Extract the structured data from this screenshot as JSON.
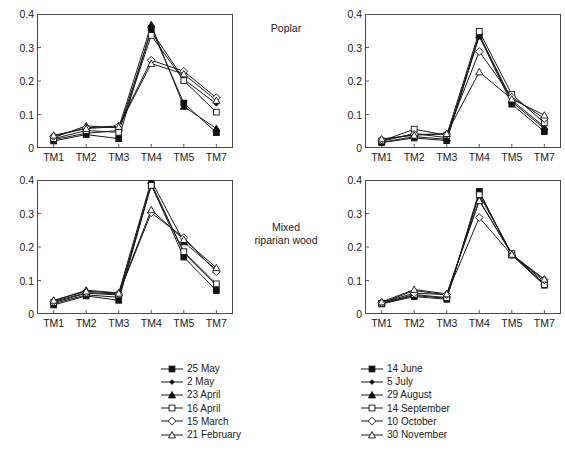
{
  "figure": {
    "row_labels": {
      "top": "Poplar",
      "bottom_line1": "Mixed",
      "bottom_line2": "riparian wood"
    },
    "caption_partial": ""
  },
  "axis": {
    "y_ticks": [
      "0",
      "0.1",
      "0.2",
      "0.3",
      "0.4"
    ],
    "x_ticks": [
      "TM1",
      "TM2",
      "TM3",
      "TM4",
      "TM5",
      "TM7"
    ]
  },
  "legends": {
    "left": {
      "name": "spring-dates-legend",
      "items": [
        {
          "label": "25 May",
          "marker": "filled-square"
        },
        {
          "label": "2 May",
          "marker": "filled-diamond"
        },
        {
          "label": "23 April",
          "marker": "filled-triangle"
        },
        {
          "label": "16 April",
          "marker": "open-square"
        },
        {
          "label": "15 March",
          "marker": "open-diamond"
        },
        {
          "label": "21 February",
          "marker": "open-triangle"
        }
      ]
    },
    "right": {
      "name": "autumn-dates-legend",
      "items": [
        {
          "label": "14 June",
          "marker": "filled-square"
        },
        {
          "label": "5 July",
          "marker": "filled-diamond"
        },
        {
          "label": "29 August",
          "marker": "filled-triangle"
        },
        {
          "label": "14 September",
          "marker": "open-square"
        },
        {
          "label": "10 October",
          "marker": "open-diamond"
        },
        {
          "label": "30 November",
          "marker": "open-triangle"
        }
      ]
    }
  },
  "chart_data": [
    {
      "id": "poplar-spring",
      "type": "line",
      "title": "Poplar",
      "panel": "top-left",
      "legend_ref": "left",
      "categories": [
        "TM1",
        "TM2",
        "TM3",
        "TM4",
        "TM5",
        "TM7"
      ],
      "xlabel": "",
      "ylabel": "",
      "ylim": [
        0,
        0.4
      ],
      "yticks": [
        0,
        0.1,
        0.2,
        0.3,
        0.4
      ],
      "grid": false,
      "legend_position": "below",
      "series": [
        {
          "name": "25 May",
          "marker": "filled-square",
          "values": [
            0.021,
            0.04,
            0.028,
            0.357,
            0.134,
            0.046
          ]
        },
        {
          "name": "2 May",
          "marker": "filled-diamond",
          "values": [
            0.025,
            0.044,
            0.052,
            0.35,
            0.205,
            0.132
          ]
        },
        {
          "name": "23 April",
          "marker": "filled-triangle",
          "values": [
            0.031,
            0.066,
            0.06,
            0.368,
            0.124,
            0.058
          ]
        },
        {
          "name": "16 April",
          "marker": "open-square",
          "values": [
            0.028,
            0.052,
            0.047,
            0.336,
            0.201,
            0.107
          ]
        },
        {
          "name": "15 March",
          "marker": "open-diamond",
          "values": [
            0.035,
            0.06,
            0.066,
            0.262,
            0.229,
            0.15
          ]
        },
        {
          "name": "21 February",
          "marker": "open-triangle",
          "values": [
            0.038,
            0.058,
            0.064,
            0.252,
            0.221,
            0.142
          ]
        }
      ]
    },
    {
      "id": "poplar-autumn",
      "type": "line",
      "title": "Poplar",
      "panel": "top-right",
      "legend_ref": "right",
      "categories": [
        "TM1",
        "TM2",
        "TM3",
        "TM4",
        "TM5",
        "TM7"
      ],
      "xlabel": "",
      "ylabel": "",
      "ylim": [
        0,
        0.4
      ],
      "yticks": [
        0,
        0.1,
        0.2,
        0.3,
        0.4
      ],
      "grid": false,
      "legend_position": "below",
      "series": [
        {
          "name": "14 June",
          "marker": "filled-square",
          "values": [
            0.016,
            0.03,
            0.022,
            0.334,
            0.131,
            0.049
          ]
        },
        {
          "name": "5 July",
          "marker": "filled-diamond",
          "values": [
            0.017,
            0.034,
            0.026,
            0.336,
            0.138,
            0.058
          ]
        },
        {
          "name": "29 August",
          "marker": "filled-triangle",
          "values": [
            0.02,
            0.043,
            0.031,
            0.338,
            0.143,
            0.063
          ]
        },
        {
          "name": "14 September",
          "marker": "open-square",
          "values": [
            0.021,
            0.056,
            0.038,
            0.348,
            0.16,
            0.075
          ]
        },
        {
          "name": "10 October",
          "marker": "open-diamond",
          "values": [
            0.024,
            0.041,
            0.041,
            0.288,
            0.152,
            0.088
          ]
        },
        {
          "name": "30 November",
          "marker": "open-triangle",
          "values": [
            0.027,
            0.038,
            0.043,
            0.227,
            0.146,
            0.098
          ]
        }
      ]
    },
    {
      "id": "mixed-riparian-spring",
      "type": "line",
      "title": "Mixed riparian wood",
      "panel": "bottom-left",
      "legend_ref": "left",
      "categories": [
        "TM1",
        "TM2",
        "TM3",
        "TM4",
        "TM5",
        "TM7"
      ],
      "xlabel": "",
      "ylabel": "",
      "ylim": [
        0,
        0.4
      ],
      "yticks": [
        0,
        0.1,
        0.2,
        0.3,
        0.4
      ],
      "grid": false,
      "legend_position": "below",
      "series": [
        {
          "name": "25 May",
          "marker": "filled-square",
          "values": [
            0.027,
            0.054,
            0.041,
            0.386,
            0.17,
            0.07
          ]
        },
        {
          "name": "2 May",
          "marker": "filled-diamond",
          "values": [
            0.031,
            0.057,
            0.05,
            0.39,
            0.182,
            0.085
          ]
        },
        {
          "name": "23 April",
          "marker": "filled-triangle",
          "values": [
            0.039,
            0.071,
            0.063,
            0.398,
            0.215,
            0.132
          ]
        },
        {
          "name": "16 April",
          "marker": "open-square",
          "values": [
            0.034,
            0.062,
            0.057,
            0.384,
            0.186,
            0.09
          ]
        },
        {
          "name": "15 March",
          "marker": "open-diamond",
          "values": [
            0.037,
            0.064,
            0.06,
            0.302,
            0.228,
            0.126
          ]
        },
        {
          "name": "21 February",
          "marker": "open-triangle",
          "values": [
            0.041,
            0.068,
            0.062,
            0.311,
            0.222,
            0.138
          ]
        }
      ]
    },
    {
      "id": "mixed-riparian-autumn",
      "type": "line",
      "title": "Mixed riparian wood",
      "panel": "bottom-right",
      "legend_ref": "right",
      "categories": [
        "TM1",
        "TM2",
        "TM3",
        "TM4",
        "TM5",
        "TM7"
      ],
      "xlabel": "",
      "ylabel": "",
      "ylim": [
        0,
        0.4
      ],
      "yticks": [
        0,
        0.1,
        0.2,
        0.3,
        0.4
      ],
      "grid": false,
      "legend_position": "below",
      "series": [
        {
          "name": "14 June",
          "marker": "filled-square",
          "values": [
            0.03,
            0.052,
            0.044,
            0.366,
            0.176,
            0.086
          ]
        },
        {
          "name": "5 July",
          "marker": "filled-diamond",
          "values": [
            0.031,
            0.055,
            0.047,
            0.362,
            0.177,
            0.09
          ]
        },
        {
          "name": "29 August",
          "marker": "filled-triangle",
          "values": [
            0.033,
            0.07,
            0.057,
            0.34,
            0.179,
            0.096
          ]
        },
        {
          "name": "14 September",
          "marker": "open-square",
          "values": [
            0.032,
            0.058,
            0.049,
            0.356,
            0.18,
            0.088
          ]
        },
        {
          "name": "10 October",
          "marker": "open-diamond",
          "values": [
            0.034,
            0.062,
            0.058,
            0.288,
            0.176,
            0.102
          ]
        },
        {
          "name": "30 November",
          "marker": "open-triangle",
          "values": [
            0.036,
            0.073,
            0.06,
            0.338,
            0.178,
            0.104
          ]
        }
      ]
    }
  ]
}
